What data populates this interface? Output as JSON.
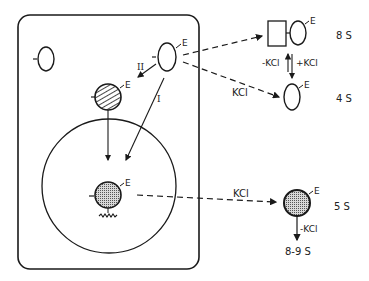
{
  "diagram": {
    "colors": {
      "stroke": "#1a1a1a",
      "background": "#ffffff",
      "fill_dotted": "#9a9a9a"
    },
    "cell": {
      "label_free_subunit": "-",
      "cytoplasmic_subunit": {
        "tag": "E",
        "stroke_mark": "-"
      },
      "hatched_particle": {
        "tag": "E",
        "stroke_mark": "-"
      },
      "pathway_labels": {
        "path_II": "II",
        "path_I": "I"
      },
      "nucleus": {
        "particle": {
          "tag": "E",
          "stroke_mark": "-"
        },
        "dna_glyph": "wavy-line"
      }
    },
    "complexes": [
      {
        "id": "8s",
        "tag": "E",
        "sedimentation": "8 S",
        "shape": "square+oval"
      },
      {
        "id": "4s",
        "tag": "E",
        "sedimentation": "4 S",
        "shape": "oval"
      },
      {
        "id": "5s",
        "tag": "E",
        "sedimentation": "5 S",
        "shape": "dotted-circle"
      }
    ],
    "equilibrium": {
      "left_label": "-KCl",
      "right_label": "+KCl"
    },
    "arrows": {
      "to_4s_label": "KCl",
      "to_5s_label": "KCl",
      "from_5s_label": "-KCl",
      "from_5s_result": "8-9 S"
    }
  }
}
